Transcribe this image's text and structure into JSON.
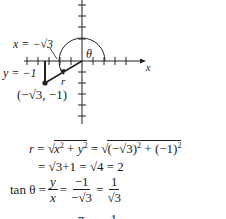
{
  "diagram": {
    "labels": {
      "x_eq": "x = −√3",
      "y_eq": "y = −1",
      "theta": "θ",
      "r": "r",
      "point": "(−√3, −1)",
      "x_axis": "x"
    },
    "point": {
      "x": "−√3",
      "y": "−1"
    }
  },
  "equations": {
    "line1_lhs": "r",
    "line1_a": "x",
    "line1_b": "y",
    "line1_rhs_a": "−√3",
    "line1_rhs_b": "(−1)",
    "line2": "= √3+1 = √4 = 2",
    "line3_lhs": "tan θ =",
    "line3_f1_num": "y",
    "line3_f1_den": "x",
    "line3_f2_num": "−1",
    "line3_f2_den": "−√3",
    "line3_f3_num": "1",
    "line3_f3_den": "√3",
    "line4_partial": "π        1"
  }
}
